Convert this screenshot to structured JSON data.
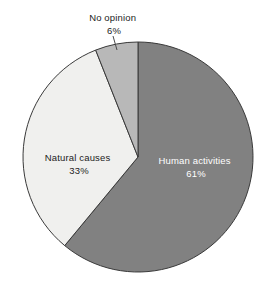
{
  "chart_data": {
    "type": "pie",
    "title": "",
    "subtitle": "",
    "xlabel": "",
    "ylabel": "",
    "legend_position": "none",
    "grid": false,
    "unit": "%",
    "start_angle_deg": 0,
    "direction": "clockwise",
    "categories": [
      "Human activities",
      "Natural causes",
      "No opinion"
    ],
    "values": [
      61,
      33,
      6
    ],
    "slices": [
      {
        "label": "Human activities",
        "value": 61,
        "value_text": "61%",
        "color": "#818181",
        "label_placement": "inside",
        "label_color": "#ffffff"
      },
      {
        "label": "Natural causes",
        "value": 33,
        "value_text": "33%",
        "color": "#f0f0ee",
        "label_placement": "inside",
        "label_color": "#1c1c1c"
      },
      {
        "label": "No opinion",
        "value": 6,
        "value_text": "6%",
        "color": "#b8b8b8",
        "label_placement": "outside",
        "label_color": "#1c1c1c"
      }
    ]
  },
  "figure": {
    "background": "#ffffff",
    "outline_color": "#3a3a3a",
    "center_x": 138,
    "center_y": 157,
    "radius": 115
  },
  "labels": {
    "no_opinion": {
      "name": "No opinion",
      "value": "6%",
      "x": 114,
      "y_name": 18,
      "y_value": 31
    },
    "natural_causes": {
      "name": "Natural causes",
      "value": "33%",
      "x": 79,
      "y_name": 158,
      "y_value": 171
    },
    "human_activities": {
      "name": "Human activities",
      "value": "61%",
      "x": 196,
      "y_name": 161,
      "y_value": 174
    }
  }
}
